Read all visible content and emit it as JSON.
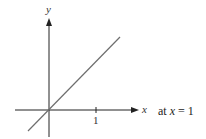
{
  "figure": {
    "axes": {
      "x_label": "x",
      "y_label": "y",
      "x_ticks": [
        {
          "value": 1,
          "label": "1"
        }
      ]
    },
    "line": {
      "description": "straight line through origin with positive slope",
      "color": "#666666"
    },
    "annotation": {
      "prefix": "at ",
      "variable": "x",
      "suffix": " = 1"
    },
    "colors": {
      "axis": "#222222",
      "line": "#6e6e6e",
      "background": "#ffffff"
    }
  }
}
